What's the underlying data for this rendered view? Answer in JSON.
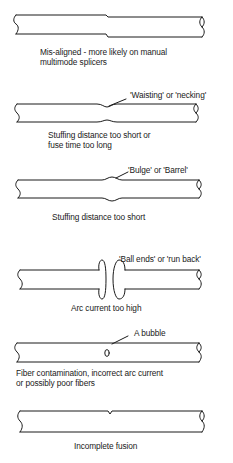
{
  "items": [
    {
      "id": "misaligned",
      "annotation": "",
      "caption_lines": [
        "Mis-aligned - more likely on manual",
        "multimode splicers"
      ]
    },
    {
      "id": "waisting",
      "annotation": "'Waisting' or 'necking'",
      "caption_lines": [
        "Stuffing distance too short or",
        "fuse time too long"
      ]
    },
    {
      "id": "bulge",
      "annotation": "'Bulge' or 'Barrel'",
      "caption_lines": [
        "Stuffing distance too short"
      ]
    },
    {
      "id": "ball-ends",
      "annotation": "'Ball ends' or 'run back'",
      "caption_lines": [
        "Arc current too high"
      ]
    },
    {
      "id": "bubble",
      "annotation": "A bubble",
      "caption_lines": [
        "Fiber contamination, incorrect arc current",
        "or possibly poor fibers"
      ]
    },
    {
      "id": "incomplete-fusion",
      "annotation": "",
      "caption_lines": [
        "Incomplete fusion"
      ]
    }
  ],
  "colors": {
    "line": "#1a1a1a",
    "background": "#ffffff"
  }
}
